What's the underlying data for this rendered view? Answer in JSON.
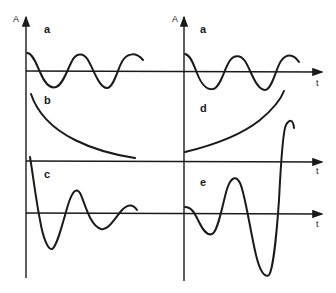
{
  "figure": {
    "axis_label_y": "A",
    "axis_label_t": "t",
    "panels": [
      {
        "id": "a",
        "label": "a",
        "description": "sustained sinusoidal oscillation (left)"
      },
      {
        "id": "b",
        "label": "b",
        "description": "monotonic exponential decay"
      },
      {
        "id": "c",
        "label": "c",
        "description": "damped oscillation"
      },
      {
        "id": "a2",
        "label": "a",
        "description": "sustained sinusoidal oscillation (right)"
      },
      {
        "id": "d",
        "label": "d",
        "description": "monotonic exponential growth"
      },
      {
        "id": "e",
        "label": "e",
        "description": "growing oscillation"
      }
    ]
  }
}
